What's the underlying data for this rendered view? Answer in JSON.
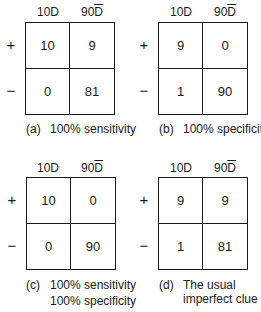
{
  "figure": {
    "column_headers": {
      "diseased": "10D",
      "not_diseased_count": "90",
      "not_diseased_symbol": "D"
    },
    "row_labels": {
      "positive": "+",
      "negative": "−"
    },
    "panels": [
      {
        "id": "a",
        "tag": "(a)",
        "caption_line1": "100% sensitivity",
        "caption_line2": "",
        "cells": {
          "pos_D": "10",
          "pos_notD": "9",
          "neg_D": "0",
          "neg_notD": "81"
        }
      },
      {
        "id": "b",
        "tag": "(b)",
        "caption_line1": "100% specificity",
        "caption_line2": "",
        "cells": {
          "pos_D": "9",
          "pos_notD": "0",
          "neg_D": "1",
          "neg_notD": "90"
        }
      },
      {
        "id": "c",
        "tag": "(c)",
        "caption_line1": "100% sensitivity",
        "caption_line2": "100% specificity",
        "cells": {
          "pos_D": "10",
          "pos_notD": "0",
          "neg_D": "0",
          "neg_notD": "90"
        }
      },
      {
        "id": "d",
        "tag": "(d)",
        "caption_line1": "The usual",
        "caption_line2": "imperfect clue",
        "cells": {
          "pos_D": "9",
          "pos_notD": "9",
          "neg_D": "1",
          "neg_notD": "81"
        }
      }
    ]
  }
}
